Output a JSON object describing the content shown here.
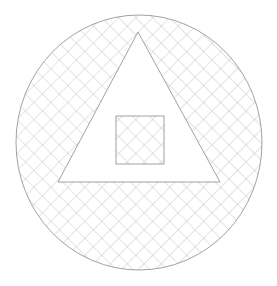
{
  "figure": {
    "title": "Cross-hatched circle containing unfilled triangle with cross-hatched square",
    "canvas": {
      "width": 277,
      "height": 286,
      "background_color": "#ffffff"
    },
    "style": {
      "outline_color": "#8a8a8a",
      "outline_width": 0.8,
      "hatch_color": "#b0b0b0",
      "hatch_width": 0.7,
      "hatch_angle_degrees": 45,
      "hatch_spacing_px": 12
    },
    "shapes": [
      {
        "name": "circle",
        "kind": "ellipse",
        "filled": "cross-hatch",
        "cx": 139,
        "cy": 142.5,
        "rx": 123,
        "ry": 127.5,
        "bounds": {
          "left": 16,
          "top": 15,
          "right": 262,
          "bottom": 270
        }
      },
      {
        "name": "triangle",
        "kind": "polygon",
        "filled": "none",
        "points": "138,32 220,182 58,182",
        "apex": {
          "x": 138,
          "y": 32
        },
        "bottom_left": {
          "x": 58,
          "y": 182
        },
        "bottom_right": {
          "x": 220,
          "y": 182
        }
      },
      {
        "name": "square",
        "kind": "rect",
        "filled": "cross-hatch",
        "x": 116,
        "y": 116,
        "width": 48,
        "height": 48,
        "bounds": {
          "left": 116,
          "top": 116,
          "right": 164,
          "bottom": 164
        }
      }
    ]
  }
}
